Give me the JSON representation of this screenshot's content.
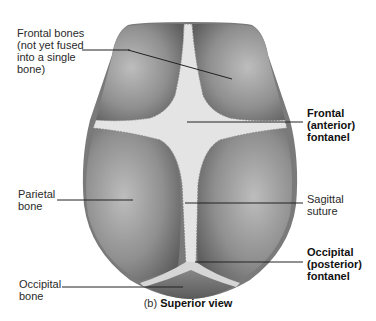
{
  "figure": {
    "caption_prefix": "(b)",
    "caption_title": "Superior view"
  },
  "labels": {
    "frontal_bones": [
      "Frontal bones",
      "(not yet fused",
      "into a single",
      "bone)"
    ],
    "frontal_fontanel": [
      "Frontal",
      "(anterior)",
      "fontanel"
    ],
    "parietal_bone": [
      "Parietal",
      "bone"
    ],
    "sagittal_suture": [
      "Sagittal",
      "suture"
    ],
    "occipital_fontanel": [
      "Occipital",
      "(posterior)",
      "fontanel"
    ],
    "occipital_bone": [
      "Occipital",
      "bone"
    ]
  },
  "colors": {
    "skull_dark": "#6e6e6e",
    "skull_mid": "#9a9a9a",
    "fontanel": "#e6e6e6",
    "leader_line": "#222222",
    "label_highlight": "#ececec"
  }
}
